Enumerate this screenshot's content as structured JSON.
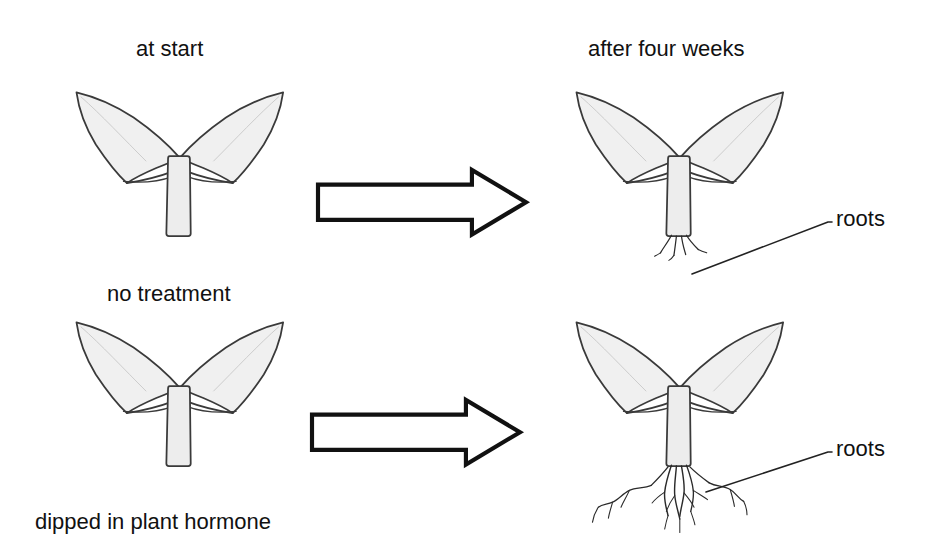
{
  "diagram": {
    "title_visible": false,
    "background_color": "#ffffff",
    "ink_color": "#1a1a1a",
    "leaf_fill_color": "#f0f0f0",
    "stem_fill_color": "#ededed",
    "arrow_fill_color": "#ffffff"
  },
  "headers": {
    "left": "at start",
    "right": "after four weeks"
  },
  "rows": [
    {
      "treatment_label": "no treatment",
      "start_plant": {
        "name": "cutting-no-roots",
        "has_roots": false,
        "leaf_count": 2
      },
      "arrow": {
        "name": "process-arrow",
        "direction": "right"
      },
      "result_plant": {
        "name": "cutting-few-roots",
        "has_roots": true,
        "root_description": "few short roots",
        "root_count": 5,
        "leaf_count": 2
      },
      "callout": {
        "label": "roots",
        "has_leader_line": true
      }
    },
    {
      "treatment_label": "dipped in plant hormone",
      "start_plant": {
        "name": "cutting-no-roots",
        "has_roots": false,
        "leaf_count": 2
      },
      "arrow": {
        "name": "process-arrow",
        "direction": "right"
      },
      "result_plant": {
        "name": "cutting-many-roots",
        "has_roots": true,
        "root_description": "many long branched roots",
        "root_count": 12,
        "leaf_count": 2
      },
      "callout": {
        "label": "roots",
        "has_leader_line": true
      }
    }
  ]
}
